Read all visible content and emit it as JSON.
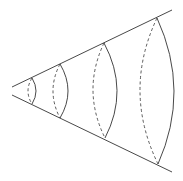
{
  "diagram": {
    "type": "cone-cross-sections",
    "stroke_color": "#333333",
    "background": "#ffffff",
    "cone": {
      "top_edge": {
        "x1": 12,
        "y1": 87,
        "x2": 172,
        "y2": 10
      },
      "bottom_edge": {
        "x1": 12,
        "y1": 95,
        "x2": 172,
        "y2": 172
      }
    },
    "sections": [
      {
        "top": [
          32,
          78
        ],
        "bottom": [
          32,
          104
        ],
        "front_bulge": 36,
        "back_bulge": 28
      },
      {
        "top": [
          60,
          64
        ],
        "bottom": [
          60,
          118
        ],
        "front_bulge": 68,
        "back_bulge": 53
      },
      {
        "top": [
          104,
          43
        ],
        "bottom": [
          105,
          138
        ],
        "front_bulge": 117,
        "back_bulge": 93
      },
      {
        "top": [
          157,
          18
        ],
        "bottom": [
          158,
          164
        ],
        "front_bulge": 174,
        "back_bulge": 140
      }
    ]
  }
}
